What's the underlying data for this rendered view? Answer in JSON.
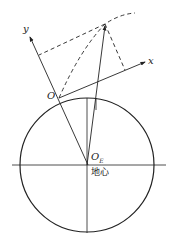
{
  "labels": {
    "y_axis": "y",
    "x_axis": "x",
    "origin": "O",
    "earth_center": "O",
    "earth_center_sub": "E",
    "earth_center_cn": "地心"
  }
}
